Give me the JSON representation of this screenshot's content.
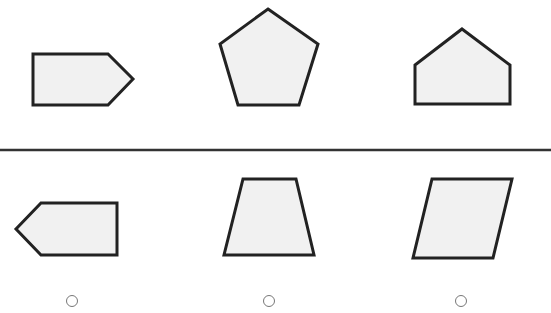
{
  "colors": {
    "shape_fill": "#f1f1f1",
    "shape_stroke": "#222222",
    "divider": "#333333",
    "radio_stroke": "#777777",
    "background": "#ffffff"
  },
  "divider": {
    "y": 150
  },
  "question_row": {
    "shapes": [
      {
        "name": "right-pointing-pentagon-arrow",
        "points": "33,54 108,54 133,79 108,105 33,105"
      },
      {
        "name": "regular-pentagon",
        "points": "268,9 318,44 299,105 238,105 220,44"
      },
      {
        "name": "house-pentagon",
        "points": "462,29 510,65 510,104 415,104 415,65"
      }
    ]
  },
  "answer_row": {
    "options": [
      {
        "name": "left-pointing-pentagon-arrow",
        "points": "41,203 117,203 117,255 41,255 16,229",
        "radio": {
          "cx": 72,
          "cy": 301,
          "r": 5.5,
          "selected": false
        }
      },
      {
        "name": "trapezoid",
        "points": "243,179 296,179 314,255 224,255",
        "radio": {
          "cx": 269,
          "cy": 301,
          "r": 5.5,
          "selected": false
        }
      },
      {
        "name": "parallelogram",
        "points": "432,179 512,179 493,258 413,258",
        "radio": {
          "cx": 461,
          "cy": 301,
          "r": 5.5,
          "selected": false
        }
      }
    ]
  }
}
